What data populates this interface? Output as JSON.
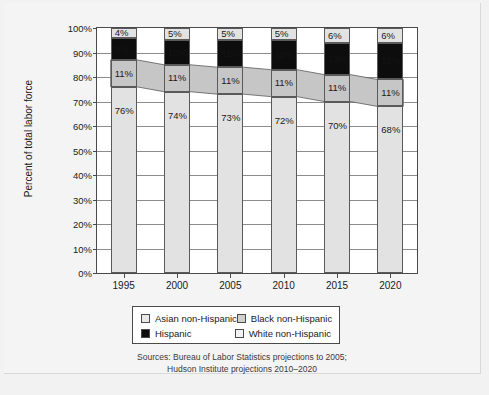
{
  "chart_data": {
    "type": "bar",
    "stacked": true,
    "title": "",
    "xlabel": "",
    "ylabel": "Percent of total labor force",
    "ylim": [
      0,
      100
    ],
    "ytick_labels": [
      "0%",
      "10%",
      "20%",
      "30%",
      "40%",
      "50%",
      "60%",
      "70%",
      "80%",
      "90%",
      "100%"
    ],
    "ytick_values": [
      0,
      10,
      20,
      30,
      40,
      50,
      60,
      70,
      80,
      90,
      100
    ],
    "grid": true,
    "categories": [
      "1995",
      "2000",
      "2005",
      "2010",
      "2015",
      "2020"
    ],
    "series": [
      {
        "name": "White non-Hispanic",
        "values": [
          76,
          74,
          73,
          72,
          70,
          68
        ],
        "labels": [
          "76%",
          "74%",
          "73%",
          "72%",
          "70%",
          "68%"
        ],
        "color": "#e2e2e2"
      },
      {
        "name": "Black non-Hispanic",
        "values": [
          11,
          11,
          11,
          11,
          11,
          11
        ],
        "labels": [
          "11%",
          "11%",
          "11%",
          "11%",
          "11%",
          "11%"
        ],
        "color": "#c6c6c6"
      },
      {
        "name": "Hispanic",
        "values": [
          9,
          10,
          11,
          12,
          13,
          15
        ],
        "labels": [
          "9%",
          "10%",
          "11%",
          "12%",
          "13%",
          "15%"
        ],
        "color": "#0d0d0d"
      },
      {
        "name": "Asian non-Hispanic",
        "values": [
          4,
          5,
          5,
          5,
          6,
          6
        ],
        "labels": [
          "4%",
          "5%",
          "5%",
          "5%",
          "6%",
          "6%"
        ],
        "color": "#e2e2e2"
      }
    ],
    "legend_position": "bottom",
    "legend_entries": [
      {
        "label": "Asian non-Hispanic",
        "swatch": "sw-asian"
      },
      {
        "label": "Black non-Hispanic",
        "swatch": "sw-blacknh"
      },
      {
        "label": "Hispanic",
        "swatch": "sw-hisp"
      },
      {
        "label": "White non-Hispanic",
        "swatch": "sw-whitenh"
      }
    ],
    "sources": [
      "Sources: Bureau of Labor Statistics projections to 2005;",
      "Hudson Institute projections 2010–2020"
    ]
  }
}
